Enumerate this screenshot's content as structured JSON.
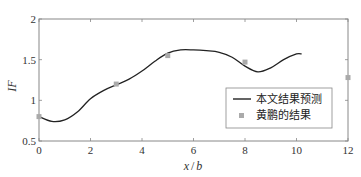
{
  "chart_data": {
    "type": "line",
    "title": "",
    "xlabel": "x / b",
    "ylabel": "IF",
    "xlim": [
      0,
      12
    ],
    "ylim": [
      0.5,
      2
    ],
    "x_ticks": [
      "0",
      "2",
      "4",
      "6",
      "8",
      "10",
      "12"
    ],
    "y_ticks": [
      "0.5",
      "1",
      "1.5",
      "2"
    ],
    "grid": false,
    "legend_position": "lower right (inside)",
    "series": [
      {
        "name": "本文结果预测",
        "style": "solid line",
        "color": "#222222",
        "x": [
          0,
          0.5,
          1,
          1.5,
          2,
          2.5,
          3,
          3.5,
          4,
          4.5,
          5,
          5.5,
          6,
          6.5,
          7,
          7.5,
          8,
          8.5,
          9,
          9.5,
          10,
          10.2
        ],
        "y": [
          0.8,
          0.74,
          0.76,
          0.86,
          1.02,
          1.12,
          1.19,
          1.26,
          1.36,
          1.48,
          1.58,
          1.62,
          1.62,
          1.61,
          1.59,
          1.53,
          1.42,
          1.35,
          1.4,
          1.5,
          1.57,
          1.57
        ]
      },
      {
        "name": "黄鹏的结果",
        "style": "square markers",
        "color": "#999999",
        "x": [
          0,
          3,
          5,
          8,
          12
        ],
        "y": [
          0.8,
          1.2,
          1.55,
          1.47,
          1.28
        ]
      }
    ]
  },
  "legend": {
    "items": [
      {
        "label": "本文结果预测"
      },
      {
        "label": "黄鹏的结果"
      }
    ]
  },
  "axes": {
    "xlabel_x": "x",
    "xlabel_sep": "/",
    "xlabel_b": "b",
    "ylabel": "IF"
  }
}
